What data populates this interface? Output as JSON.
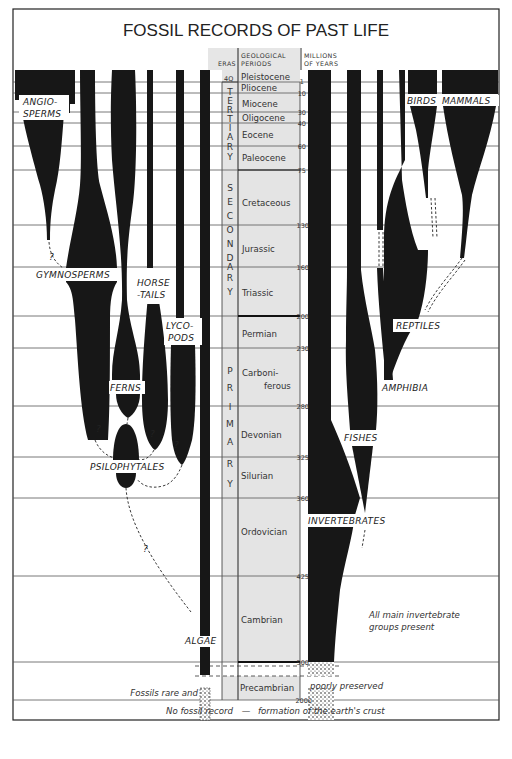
{
  "title": "FOSSIL RECORDS OF PAST LIFE",
  "headers": {
    "eras": "ERAS",
    "periods_line1": "GEOLOGICAL",
    "periods_line2": "PERIODS",
    "years_line1": "MILLIONS",
    "years_line2": "OF YEARS"
  },
  "quaternary_marker": "4Q",
  "eras": [
    {
      "name": "TERTIARY",
      "letters": [
        "T",
        "E",
        "R",
        "T",
        "I",
        "A",
        "R",
        "Y"
      ]
    },
    {
      "name": "SECONDARY",
      "letters": [
        "S",
        "E",
        "C",
        "O",
        "N",
        "D",
        "A",
        "R",
        "Y"
      ]
    },
    {
      "name": "PRIMARY",
      "letters": [
        "P",
        "R",
        "I",
        "M",
        "A",
        "R",
        "Y"
      ]
    }
  ],
  "periods": [
    {
      "name": "Pleistocene"
    },
    {
      "name": "Pliocene"
    },
    {
      "name": "Miocene"
    },
    {
      "name": "Oligocene"
    },
    {
      "name": "Eocene"
    },
    {
      "name": "Paleocene"
    },
    {
      "name": "Cretaceous"
    },
    {
      "name": "Jurassic"
    },
    {
      "name": "Triassic"
    },
    {
      "name": "Permian"
    },
    {
      "name": "Carboni-",
      "name2": "ferous"
    },
    {
      "name": "Devonian"
    },
    {
      "name": "Silurian"
    },
    {
      "name": "Ordovician"
    },
    {
      "name": "Cambrian"
    },
    {
      "name": "Precambrian"
    }
  ],
  "ticks": [
    "1",
    "10",
    "30",
    "40",
    "60",
    "75",
    "130",
    "160",
    "200",
    "230",
    "280",
    "325",
    "360",
    "425",
    "500",
    "2000"
  ],
  "plant_groups": {
    "angiosperms_1": "ANGIO-",
    "angiosperms_2": "SPERMS",
    "gymnosperms": "GYMNOSPERMS",
    "horsetails_1": "HORSE",
    "horsetails_2": "-TAILS",
    "lycopods_1": "LYCO-",
    "lycopods_2": "PODS",
    "ferns": "FERNS",
    "psilophytales": "PSILOPHYTALES",
    "algae": "ALGAE"
  },
  "animal_groups": {
    "birds": "BIRDS",
    "mammals": "MAMMALS",
    "reptiles": "REPTILES",
    "amphibia": "AMPHIBIA",
    "fishes": "FISHES",
    "invertebrates": "INVERTEBRATES"
  },
  "uncertainty_mark": "?",
  "notes": {
    "invertebrates_1": "All main invertebrate",
    "invertebrates_2": "groups present",
    "precambrian_left": "Fossils rare and",
    "precambrian_right": "poorly preserved",
    "footer_left": "No fossil record",
    "footer_dash": "—",
    "footer_right": "formation of the earth's crust"
  },
  "colors": {
    "ink": "#171717",
    "timeline_fill": "#e4e4e4",
    "gridline": "#555555",
    "background": "#ffffff"
  }
}
